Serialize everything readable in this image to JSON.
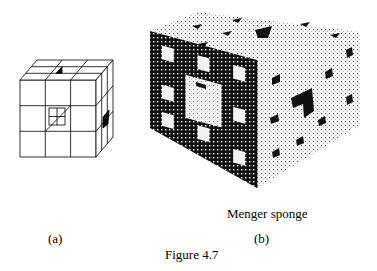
{
  "figure": {
    "caption": "Figure 4.7",
    "panels": [
      {
        "id": "a",
        "label": "(a)",
        "description": "3x3x3 subdivided cube with central cavity"
      },
      {
        "id": "b",
        "label": "(b)",
        "title": "Menger sponge"
      }
    ]
  },
  "colors": {
    "ink": "#000000",
    "paper": "#ffffff",
    "dark_face": "#111111",
    "light_face": "#f4f4f4"
  }
}
